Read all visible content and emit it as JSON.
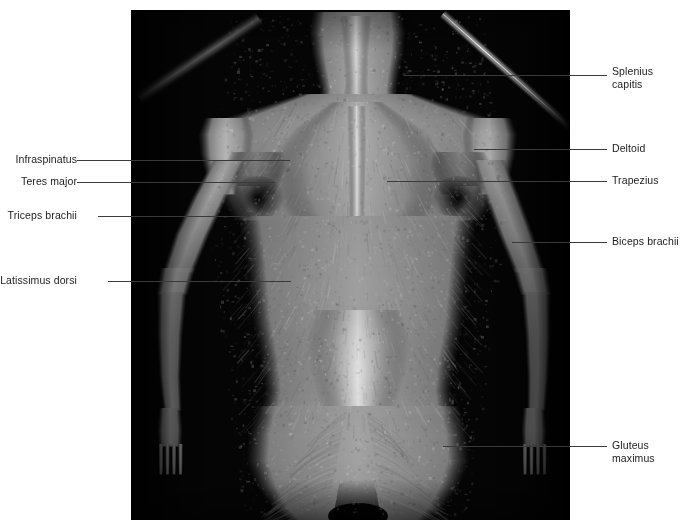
{
  "figure": {
    "kind": "anatomy-photograph",
    "view": "posterior (back) view of dissected human cadaver, superficial muscles",
    "background_color": "#050505",
    "tissue_color": "#c8c6c0",
    "frame": {
      "left": 131,
      "top": 10,
      "width": 439,
      "height": 510
    }
  },
  "page": {
    "background_color": "#ffffff",
    "text_color": "#1c1c1c",
    "leader_color": "#3a3a3a"
  },
  "labels": {
    "left": [
      {
        "id": "infraspinatus",
        "text": "Infraspinatus",
        "line2": ""
      },
      {
        "id": "teres-major",
        "text": "Teres major",
        "line2": ""
      },
      {
        "id": "triceps-brachii",
        "text": "Triceps brachii",
        "line2": ""
      },
      {
        "id": "latissimus-dorsi",
        "text": "Latissimus dorsi",
        "line2": ""
      }
    ],
    "right": [
      {
        "id": "splenius-capitis",
        "text": "Splenius",
        "line2": "capitis"
      },
      {
        "id": "deltoid",
        "text": "Deltoid",
        "line2": ""
      },
      {
        "id": "trapezius",
        "text": "Trapezius",
        "line2": ""
      },
      {
        "id": "biceps-brachii",
        "text": "Biceps brachii",
        "line2": ""
      },
      {
        "id": "gluteus-maximus",
        "text": "Gluteus",
        "line2": "maximus"
      }
    ]
  }
}
